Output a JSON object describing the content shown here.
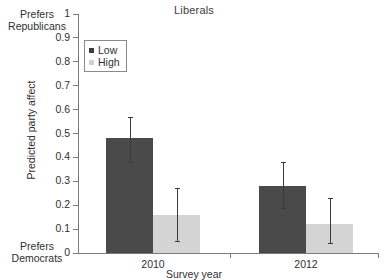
{
  "chart_data": {
    "type": "bar",
    "title": "Liberals",
    "xlabel": "Survey year",
    "ylabel": "Predicted party affect",
    "categories": [
      "2010",
      "2012"
    ],
    "series": [
      {
        "name": "Low",
        "color": "#4a4a4a",
        "values": [
          0.48,
          0.28
        ],
        "error_low": [
          0.38,
          0.19
        ],
        "error_high": [
          0.57,
          0.38
        ]
      },
      {
        "name": "High",
        "color": "#d4d4d4",
        "values": [
          0.16,
          0.12
        ],
        "error_low": [
          0.05,
          0.04
        ],
        "error_high": [
          0.27,
          0.23
        ]
      }
    ],
    "ylim": [
      0,
      1
    ],
    "ytick_labels": [
      "0",
      "0.1",
      "0.2",
      "0.3",
      "0.4",
      "0.5",
      "0.6",
      "0.7",
      "0.8",
      "0.9",
      "1"
    ],
    "ytick_values": [
      0,
      0.1,
      0.2,
      0.3,
      0.4,
      0.5,
      0.6,
      0.7,
      0.8,
      0.9,
      1
    ],
    "grid": false,
    "legend_position": "upper-left-inside",
    "annotations": {
      "axis_top_line1": "Prefers",
      "axis_top_line2": "Republicans",
      "axis_bottom_line1": "Prefers",
      "axis_bottom_line2": "Democrats"
    }
  },
  "legend": {
    "items": [
      {
        "label": "Low",
        "color": "#3f3f3f"
      },
      {
        "label": "High",
        "color": "#d0d0d0"
      }
    ]
  }
}
